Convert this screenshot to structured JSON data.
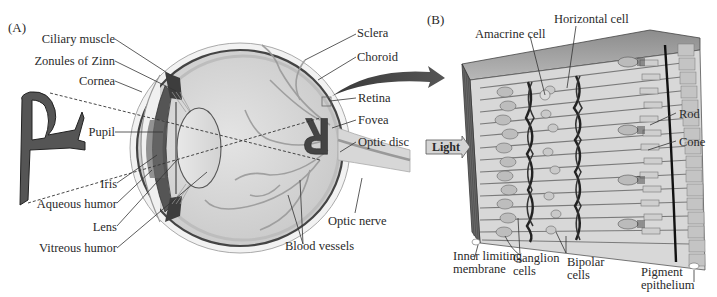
{
  "figure": {
    "panel_a": {
      "letter": "(A)",
      "labels_left": [
        {
          "id": "ciliary-muscle",
          "text": "Ciliary muscle"
        },
        {
          "id": "zonules-of-zinn",
          "text": "Zonules of Zinn"
        },
        {
          "id": "cornea",
          "text": "Cornea"
        },
        {
          "id": "pupil",
          "text": "Pupil"
        },
        {
          "id": "iris",
          "text": "Iris"
        },
        {
          "id": "aqueous-humor",
          "text": "Aqueous humor"
        },
        {
          "id": "lens",
          "text": "Lens"
        },
        {
          "id": "vitreous-humor",
          "text": "Vitreous humor"
        }
      ],
      "labels_right": [
        {
          "id": "sclera",
          "text": "Sclera"
        },
        {
          "id": "choroid",
          "text": "Choroid"
        },
        {
          "id": "retina",
          "text": "Retina"
        },
        {
          "id": "fovea",
          "text": "Fovea"
        },
        {
          "id": "optic-disc",
          "text": "Optic disc"
        },
        {
          "id": "optic-nerve",
          "text": "Optic nerve"
        },
        {
          "id": "blood-vessels",
          "text": "Blood vessels"
        }
      ],
      "object_letter": "R"
    },
    "panel_b": {
      "letter": "(B)",
      "labels_top": [
        {
          "id": "amacrine-cell",
          "text": "Amacrine cell"
        },
        {
          "id": "horizontal-cell",
          "text": "Horizontal cell"
        }
      ],
      "labels_right": [
        {
          "id": "rod",
          "text": "Rod"
        },
        {
          "id": "cone",
          "text": "Cone"
        }
      ],
      "labels_bottom": [
        {
          "id": "inner-limiting-membrane",
          "text": "Inner limiting membrane"
        },
        {
          "id": "ganglion-cells",
          "text": "Ganglion cells"
        },
        {
          "id": "bipolar-cells",
          "text": "Bipolar cells"
        },
        {
          "id": "pigment-epithelium",
          "text": "Pigment epithelium"
        }
      ],
      "light_arrow": "Light"
    },
    "colors": {
      "tissue_dark": "#4a4a4a",
      "tissue_mid": "#8a8a8a",
      "tissue_light": "#c8c8c8",
      "tissue_pale": "#dedede",
      "outline": "#333333"
    }
  }
}
